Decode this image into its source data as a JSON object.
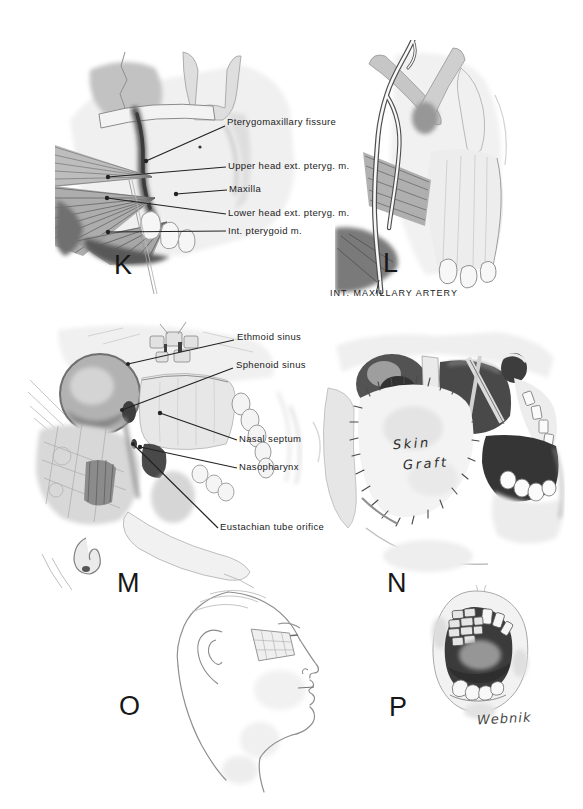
{
  "plate": {
    "paper_color": "#ffffff",
    "ink_color": "#1b1b1b",
    "figures": {
      "k": {
        "letter": "K",
        "labels": [
          "Pterygomaxillary fissure",
          "Upper head ext. pteryg. m.",
          "Maxilla",
          "Lower head ext. pteryg. m.",
          "Int. pterygoid m."
        ]
      },
      "l": {
        "letter": "L",
        "caption": "INT. MAXILLARY ARTERY"
      },
      "m": {
        "letter": "M",
        "labels": [
          "Ethmoid sinus",
          "Sphenoid sinus",
          "Nasal septum",
          "Nasopharynx",
          "Eustachian tube orifice"
        ]
      },
      "n": {
        "letter": "N",
        "annotation": [
          "Skin",
          "Graft"
        ]
      },
      "o": {
        "letter": "O"
      },
      "p": {
        "letter": "P",
        "signature": "Webnik"
      }
    }
  }
}
